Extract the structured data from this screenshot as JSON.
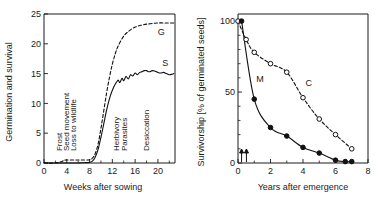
{
  "figure": {
    "panels": [
      "germination-survival",
      "survivorship"
    ]
  },
  "chart_data": [
    {
      "type": "line",
      "panel_id": "germination-survival",
      "title": "",
      "xlabel": "Weeks after sowing",
      "ylabel": "Germination and survival",
      "xlim": [
        0,
        23
      ],
      "ylim": [
        0,
        25
      ],
      "xticks": [
        0,
        4,
        8,
        12,
        16,
        20
      ],
      "xtick_labels": [
        "0",
        "4",
        "8",
        "12",
        "16",
        "20"
      ],
      "xticks_minor": [
        2,
        6,
        10,
        14,
        18,
        22
      ],
      "yticks": [
        0,
        5,
        10,
        15,
        20,
        25
      ],
      "ytick_labels": [
        "0",
        "5",
        "10",
        "15",
        "20",
        "25"
      ],
      "grid": false,
      "legend": "inline-curve-labels",
      "series": [
        {
          "name": "G",
          "label": "G",
          "style": "dashed",
          "description": "Germination",
          "x": [
            0,
            2,
            3,
            3.5,
            4,
            5,
            6,
            7,
            8,
            8.5,
            9,
            9.5,
            10,
            10.5,
            11,
            11.5,
            12,
            12.5,
            13,
            14,
            15,
            16,
            17,
            18,
            19,
            20,
            21,
            22,
            22.8
          ],
          "y": [
            0,
            0,
            0.2,
            0.45,
            0.5,
            0.5,
            0.5,
            0.5,
            0.55,
            0.8,
            1.6,
            3.2,
            5.8,
            8.8,
            11.8,
            14.4,
            16.6,
            18.3,
            19.6,
            21.3,
            22.2,
            22.8,
            23.1,
            23.3,
            23.4,
            23.5,
            23.5,
            23.5,
            23.5
          ],
          "label_pos": [
            20.6,
            21.5
          ]
        },
        {
          "name": "S",
          "label": "S",
          "style": "solid",
          "description": "Survival",
          "x": [
            0,
            4,
            6,
            7,
            8,
            8.5,
            9,
            9.5,
            10,
            10.5,
            11,
            11.5,
            12,
            12.5,
            13,
            13.3,
            13.7,
            14,
            14.4,
            14.8,
            15.2,
            15.6,
            16,
            16.4,
            16.8,
            17.2,
            17.6,
            18,
            18.5,
            19,
            19.5,
            20,
            20.5,
            21,
            21.5,
            22,
            22.5,
            22.8
          ],
          "y": [
            0,
            0,
            0,
            0.05,
            0.1,
            0.3,
            1.0,
            2.3,
            4.3,
            6.6,
            8.9,
            10.8,
            12.2,
            13.2,
            13.9,
            13.5,
            14.2,
            13.8,
            14.5,
            14.1,
            14.8,
            14.6,
            15.1,
            14.8,
            15.2,
            15.3,
            15.5,
            15.5,
            15.3,
            15.5,
            15.4,
            15.2,
            15.1,
            15.2,
            15.0,
            14.8,
            14.9,
            15.0
          ],
          "label_pos": [
            21.3,
            16.3
          ]
        }
      ],
      "annotations": [
        {
          "text": "Frost",
          "x": 3.1,
          "y": 2.0,
          "rotation": -90
        },
        {
          "text": "Seed movement",
          "x": 4.4,
          "y": 2.0,
          "rotation": -90
        },
        {
          "text": "Loss to wildlife",
          "x": 5.7,
          "y": 2.0,
          "rotation": -90
        },
        {
          "text": "Herbivory",
          "x": 13.2,
          "y": 2.0,
          "rotation": -90
        },
        {
          "text": "Parasites",
          "x": 14.6,
          "y": 2.0,
          "rotation": -90
        },
        {
          "text": "Desiccation",
          "x": 18.4,
          "y": 2.0,
          "rotation": -90
        }
      ]
    },
    {
      "type": "line",
      "panel_id": "survivorship",
      "title": "",
      "xlabel": "Years after emergence",
      "ylabel": "Survivorship [% of germinated seeds]",
      "xlim": [
        0,
        8
      ],
      "ylim": [
        0,
        105
      ],
      "xticks": [
        0,
        2,
        4,
        6,
        8
      ],
      "xtick_labels": [
        "0",
        "2",
        "4",
        "6",
        "8"
      ],
      "xticks_minor": [
        1,
        3,
        5,
        7
      ],
      "yticks": [
        0,
        50,
        100
      ],
      "ytick_labels": [
        "0",
        "50",
        "100"
      ],
      "yticks_minor": [
        10,
        20,
        30,
        40,
        60,
        70,
        80,
        90
      ],
      "grid": false,
      "legend": "inline-curve-labels",
      "series": [
        {
          "name": "C",
          "label": "C",
          "style": "dashed",
          "marker": "open-circle",
          "description": "Control cohort",
          "x": [
            0,
            0.5,
            1,
            2,
            3,
            4,
            5,
            6,
            7
          ],
          "y": [
            100,
            87,
            78,
            70,
            64,
            46,
            31,
            20,
            10
          ],
          "label_pos": [
            4.35,
            54
          ]
        },
        {
          "name": "M",
          "label": "M",
          "style": "solid",
          "marker": "filled-circle",
          "description": "Manipulated cohort",
          "x": [
            0.22,
            1,
            2,
            3,
            4,
            5,
            6,
            6.6,
            7
          ],
          "y": [
            100,
            45,
            25,
            19,
            11,
            7,
            2,
            1,
            1
          ],
          "label_pos": [
            1.35,
            57
          ]
        }
      ],
      "annotations": [
        {
          "text": "arrow-marker",
          "x": 0.22,
          "y": 0,
          "type": "up-arrow"
        },
        {
          "text": "arrow-marker",
          "x": 0.52,
          "y": 0,
          "type": "up-arrow"
        }
      ]
    }
  ]
}
